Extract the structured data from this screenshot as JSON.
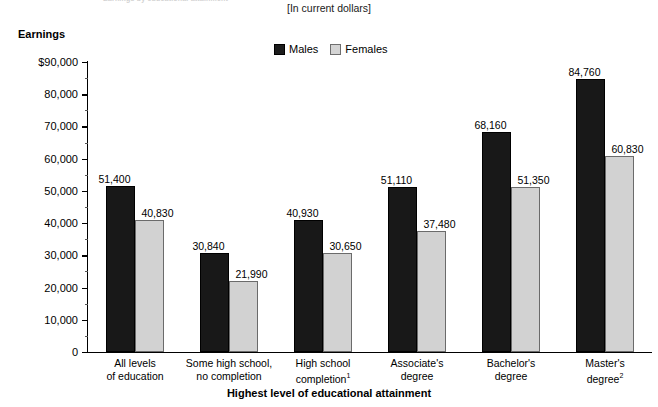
{
  "header": {
    "clipped_title": "Earnings by educational attainment",
    "units_note": "[In current dollars]",
    "y_axis_title": "Earnings",
    "x_axis_title": "Highest level of educational attainment"
  },
  "legend": {
    "position": "top-center",
    "entries": [
      {
        "label": "Males",
        "color": "#181818"
      },
      {
        "label": "Females",
        "color": "#d2d2d2"
      }
    ]
  },
  "chart_data": {
    "type": "bar",
    "title": "Earnings by educational attainment",
    "subtitle": "[In current dollars]",
    "xlabel": "Highest level of educational attainment",
    "ylabel": "Earnings",
    "ylim": [
      0,
      90000
    ],
    "grid": false,
    "legend_position": "top-center",
    "categories": [
      "All levels of education",
      "Some high school, no completion",
      "High school completion",
      "Associate's degree",
      "Bachelor's degree",
      "Master's degree"
    ],
    "category_lines": [
      [
        "All levels",
        "of education"
      ],
      [
        "Some high school,",
        "no completion"
      ],
      [
        "High school",
        "completion"
      ],
      [
        "Associate's",
        "degree"
      ],
      [
        "Bachelor's",
        "degree"
      ],
      [
        "Master's",
        "degree"
      ]
    ],
    "category_footnotes": [
      "",
      "",
      "1",
      "",
      "",
      "2"
    ],
    "series": [
      {
        "name": "Males",
        "color": "#181818",
        "values": [
          51400,
          30840,
          40930,
          51110,
          68160,
          84760
        ],
        "labels": [
          "51,400",
          "30,840",
          "40,930",
          "51,110",
          "68,160",
          "84,760"
        ]
      },
      {
        "name": "Females",
        "color": "#d2d2d2",
        "values": [
          40830,
          21990,
          30650,
          37480,
          51350,
          60830
        ],
        "labels": [
          "40,830",
          "21,990",
          "30,650",
          "37,480",
          "51,350",
          "60,830"
        ]
      }
    ],
    "y_ticks": [
      0,
      10000,
      20000,
      30000,
      40000,
      50000,
      60000,
      70000,
      80000,
      90000
    ],
    "y_tick_labels": [
      "0",
      "10,000",
      "20,000",
      "30,000",
      "40,000",
      "50,000",
      "60,000",
      "70,000",
      "80,000",
      "$90,000"
    ],
    "y_minor_tick_interval": 5000
  }
}
